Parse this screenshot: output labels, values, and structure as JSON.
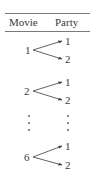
{
  "table": {
    "headers": {
      "movie": "Movie",
      "party": "Party"
    },
    "groups": [
      {
        "movie": "1",
        "parties": [
          "1",
          "2"
        ]
      },
      {
        "movie": "2",
        "parties": [
          "1",
          "2"
        ]
      },
      {
        "movie": "6",
        "parties": [
          "1",
          "2"
        ]
      }
    ],
    "ellipsis": "⋮"
  },
  "colors": {
    "text": "#3a3a3a",
    "rule": "#7a7a7a",
    "arrow": "#3a3a3a"
  }
}
